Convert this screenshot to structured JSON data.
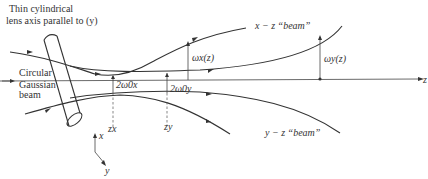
{
  "diagram": {
    "labels": {
      "lens_line1": "Thin cylindrical",
      "lens_line2": "lens axis parallel to (y)",
      "input_line1": "Circular",
      "input_line2": "Gaussian",
      "input_line3": "beam",
      "xz_beam": "x − z “beam”",
      "yz_beam": "y − z “beam”",
      "omega_x": "ωx(z)",
      "omega_y": "ωy(z)",
      "waist_x": "2ω0x",
      "waist_y": "2ω0y",
      "z_x": "zx",
      "z_y": "zy",
      "axis_z": "z",
      "axis_x": "x",
      "axis_y": "y"
    },
    "colors": {
      "ink": "#333333",
      "background": "#ffffff"
    }
  }
}
